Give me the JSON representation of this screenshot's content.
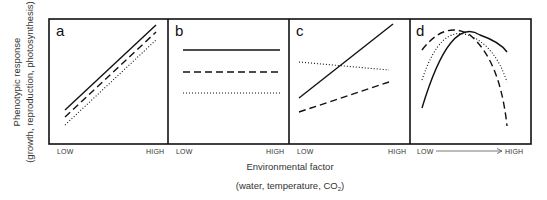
{
  "figure": {
    "y_axis": {
      "title": "Phenotypic response",
      "subtitle": "(growth, reproduction, photosynthesis)"
    },
    "x_axis": {
      "title": "Environmental factor",
      "subtitle_pre": "(water, temperature, CO",
      "subtitle_sub": "2",
      "subtitle_post": ")"
    },
    "frame": {
      "left": 49,
      "top": 19,
      "right": 531,
      "bottom": 144,
      "dividers": [
        168,
        289,
        410
      ]
    },
    "panels": [
      {
        "letter": "a",
        "low_label": "LOW",
        "high_label": "HIGH",
        "lines": [
          {
            "style": "solid",
            "points": [
              [
                65,
                110
              ],
              [
                156,
                25
              ]
            ]
          },
          {
            "style": "dashed",
            "points": [
              [
                65,
                117
              ],
              [
                156,
                32
              ]
            ]
          },
          {
            "style": "dotted",
            "points": [
              [
                65,
                125
              ],
              [
                156,
                40
              ]
            ]
          }
        ]
      },
      {
        "letter": "b",
        "low_label": "LOW",
        "high_label": "HIGH",
        "lines": [
          {
            "style": "solid",
            "points": [
              [
                183,
                50
              ],
              [
                280,
                50
              ]
            ]
          },
          {
            "style": "dashed",
            "points": [
              [
                183,
                72
              ],
              [
                280,
                72
              ]
            ]
          },
          {
            "style": "dotted",
            "points": [
              [
                183,
                93
              ],
              [
                280,
                93
              ]
            ]
          }
        ]
      },
      {
        "letter": "c",
        "low_label": "LOW",
        "high_label": "HIGH",
        "lines": [
          {
            "style": "solid",
            "points": [
              [
                299,
                98
              ],
              [
                393,
                24
              ]
            ]
          },
          {
            "style": "dashed",
            "points": [
              [
                299,
                112
              ],
              [
                389,
                82
              ]
            ]
          },
          {
            "style": "dotted",
            "points": [
              [
                299,
                62
              ],
              [
                389,
                70
              ]
            ]
          }
        ]
      },
      {
        "letter": "d",
        "low_label": "LOW",
        "high_label": "HIGH",
        "has_arrow": true,
        "curves": [
          {
            "style": "dashed",
            "d": "M422,50 Q445,20 470,35 Q500,60 507,126"
          },
          {
            "style": "dotted",
            "d": "M422,80 Q440,25 468,35 Q495,45 507,82"
          },
          {
            "style": "solid",
            "d": "M422,108 Q450,15 480,35 Q500,42 507,52"
          }
        ]
      }
    ]
  },
  "chart_data": {
    "type": "line",
    "title": "",
    "xlabel": "Environmental factor (water, temperature, CO2)",
    "ylabel": "Phenotypic response (growth, reproduction, photosynthesis)",
    "x_ticks": [
      "LOW",
      "HIGH"
    ],
    "legend": [],
    "panels": [
      {
        "panel": "a",
        "description": "parallel increasing lines",
        "series": [
          {
            "name": "solid",
            "x": [
              0,
              1
            ],
            "y": [
              0.27,
              0.96
            ]
          },
          {
            "name": "dashed",
            "x": [
              0,
              1
            ],
            "y": [
              0.21,
              0.9
            ]
          },
          {
            "name": "dotted",
            "x": [
              0,
              1
            ],
            "y": [
              0.15,
              0.84
            ]
          }
        ]
      },
      {
        "panel": "b",
        "description": "flat lines (no response)",
        "series": [
          {
            "name": "solid",
            "x": [
              0,
              1
            ],
            "y": [
              0.75,
              0.75
            ]
          },
          {
            "name": "dashed",
            "x": [
              0,
              1
            ],
            "y": [
              0.58,
              0.58
            ]
          },
          {
            "name": "dotted",
            "x": [
              0,
              1
            ],
            "y": [
              0.41,
              0.41
            ]
          }
        ]
      },
      {
        "panel": "c",
        "description": "crossing lines with different slopes",
        "series": [
          {
            "name": "solid",
            "x": [
              0,
              1
            ],
            "y": [
              0.37,
              0.96
            ]
          },
          {
            "name": "dashed",
            "x": [
              0,
              1
            ],
            "y": [
              0.26,
              0.5
            ]
          },
          {
            "name": "dotted",
            "x": [
              0,
              1
            ],
            "y": [
              0.66,
              0.59
            ]
          }
        ]
      },
      {
        "panel": "d",
        "description": "unimodal reaction norms with shifted optima",
        "series": [
          {
            "name": "dashed",
            "x": [
              0,
              0.3,
              1
            ],
            "y": [
              0.75,
              0.95,
              0.14
            ]
          },
          {
            "name": "dotted",
            "x": [
              0,
              0.5,
              1
            ],
            "y": [
              0.51,
              0.95,
              0.5
            ]
          },
          {
            "name": "solid",
            "x": [
              0,
              0.65,
              1
            ],
            "y": [
              0.29,
              0.95,
              0.74
            ]
          }
        ]
      }
    ]
  }
}
